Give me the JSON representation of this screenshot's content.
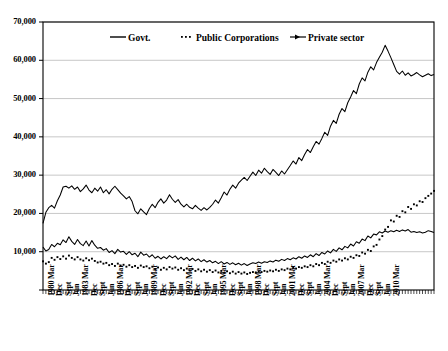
{
  "chart_data": {
    "type": "line",
    "title": "",
    "subtitle": "",
    "xlabel": "",
    "ylabel": "",
    "ylim": [
      0,
      70000
    ],
    "ytick_step": 10000,
    "ytick_labels": [
      "0",
      "10,000",
      "20,000",
      "30,000",
      "40,000",
      "50,000",
      "60,000",
      "70,000"
    ],
    "ytick_values": [
      0,
      10000,
      20000,
      30000,
      40000,
      50000,
      60000,
      70000
    ],
    "grid": "horizontal",
    "legend_position": "top-inside",
    "x_frequency": "quarterly",
    "x_start": "1980 Mar",
    "x_end": "2010 Mar",
    "xtick_labels": [
      "1980 Mar",
      "Dec",
      "Sept",
      "Jun",
      "1983 Mar",
      "Dec",
      "Sept",
      "Jun",
      "1986 Mar",
      "Dec",
      "Sept",
      "Jun",
      "1989 Mar",
      "Dec",
      "Sept",
      "Jun",
      "1992 Mar",
      "Dec",
      "Sept",
      "Jun",
      "1995 Mar",
      "Dec",
      "Sept",
      "Jun",
      "1998 Mar",
      "Dec",
      "Sept",
      "Jun",
      "2001 Mar",
      "Dec",
      "Sept",
      "Jun",
      "2004 Mar",
      "Dec",
      "Sept",
      "Jun",
      "2007 Mar",
      "Dec",
      "Sept",
      "Jun",
      "2010 Mar"
    ],
    "xtick_label_interval": 3,
    "series": [
      {
        "name": "Govt.",
        "style": "solid",
        "color": "#000000",
        "values": [
          11200,
          10200,
          10600,
          11900,
          11300,
          12200,
          11800,
          13100,
          12400,
          13900,
          12700,
          11900,
          13200,
          12100,
          11600,
          12800,
          11500,
          12900,
          11700,
          10900,
          11100,
          10400,
          10800,
          9800,
          10300,
          9500,
          10600,
          9900,
          10100,
          9300,
          10000,
          9200,
          9600,
          8700,
          9900,
          9100,
          9400,
          8600,
          9200,
          8300,
          8800,
          8100,
          8700,
          8200,
          9000,
          8400,
          8900,
          8000,
          8600,
          7900,
          8500,
          7700,
          8300,
          7600,
          8100,
          7400,
          7900,
          7300,
          7700,
          7100,
          7500,
          6900,
          7400,
          6800,
          7200,
          6700,
          7100,
          6600,
          7000,
          6500,
          6900,
          6400,
          6800,
          7100,
          6900,
          7300,
          7000,
          7400,
          7200,
          7600,
          7300,
          7800,
          7500,
          8000,
          7700,
          8200,
          7900,
          8400,
          8100,
          8700,
          8300,
          8900,
          8500,
          9200,
          8700,
          9500,
          9000,
          9800,
          9400,
          10200,
          9700,
          10600,
          10100,
          11000,
          10500,
          11400,
          11000,
          12000,
          11500,
          12600,
          12200,
          13300,
          12900,
          14100,
          13600,
          14600,
          14400,
          15200,
          14900,
          15400,
          15100,
          15500,
          15200,
          15600,
          15300,
          15700,
          15400,
          15800,
          15100,
          15300,
          15000,
          15200,
          14900,
          15100,
          15500,
          15300,
          15000
        ]
      },
      {
        "name": "Public Corporations",
        "style": "dotted",
        "color": "#000000",
        "values": [
          7500,
          6900,
          7300,
          8400,
          7900,
          8600,
          8100,
          8800,
          8200,
          9000,
          8400,
          8000,
          8600,
          8000,
          7700,
          8300,
          7800,
          8200,
          7600,
          7200,
          7400,
          6900,
          7100,
          6500,
          6800,
          6300,
          6900,
          6400,
          6600,
          6100,
          6500,
          6000,
          6300,
          5800,
          6400,
          6000,
          6200,
          5700,
          6100,
          5500,
          5900,
          5300,
          5800,
          5400,
          6000,
          5600,
          5900,
          5300,
          5700,
          5200,
          5600,
          5100,
          5500,
          5000,
          5400,
          4900,
          5300,
          4800,
          5200,
          4700,
          5100,
          4600,
          5000,
          4500,
          4900,
          4400,
          4800,
          4300,
          4700,
          4300,
          4600,
          4200,
          4500,
          4700,
          4600,
          4900,
          4700,
          5000,
          4800,
          5100,
          4900,
          5300,
          5000,
          5400,
          5200,
          5600,
          5400,
          5800,
          5600,
          6000,
          5800,
          6200,
          6000,
          6500,
          6200,
          6800,
          6500,
          7100,
          6800,
          7400,
          7100,
          7700,
          7400,
          8000,
          7700,
          8300,
          8000,
          8700,
          8400,
          9100,
          8900,
          9800,
          9500,
          10500,
          10200,
          11400,
          11800,
          13200,
          14100,
          15800,
          16500,
          18200,
          17900,
          19400,
          19100,
          20600,
          20300,
          21700,
          21200,
          22400,
          22100,
          23200,
          23000,
          24000,
          24600,
          25200,
          25900
        ]
      },
      {
        "name": "Private sector",
        "style": "solid",
        "color": "#000000",
        "values": [
          17400,
          20300,
          21500,
          22100,
          21400,
          23300,
          24800,
          26900,
          27100,
          26600,
          27200,
          26300,
          26900,
          25700,
          26400,
          27400,
          26100,
          25400,
          26600,
          25800,
          26900,
          25400,
          26200,
          25100,
          26300,
          27100,
          26200,
          25300,
          24600,
          23800,
          24400,
          23100,
          20700,
          19900,
          21200,
          20400,
          19700,
          21300,
          22400,
          21500,
          22900,
          23800,
          22700,
          23500,
          24900,
          23700,
          22900,
          23600,
          22400,
          21700,
          22400,
          21600,
          21200,
          22100,
          21400,
          20800,
          21500,
          20900,
          21600,
          22400,
          23500,
          22700,
          24100,
          25600,
          24800,
          26300,
          27400,
          26600,
          27900,
          28700,
          29400,
          28600,
          29700,
          30800,
          29900,
          31300,
          30500,
          31800,
          30900,
          30200,
          31500,
          30700,
          29900,
          31100,
          30300,
          31400,
          32500,
          33700,
          32900,
          34600,
          33800,
          35400,
          36700,
          35900,
          37400,
          38800,
          38100,
          39600,
          41200,
          40400,
          42800,
          44300,
          43500,
          45900,
          47400,
          46600,
          48900,
          50400,
          52100,
          51300,
          53800,
          55400,
          54600,
          56900,
          58300,
          57500,
          59400,
          60800,
          62100,
          63900,
          62400,
          60700,
          58900,
          57100,
          56400,
          57200,
          56100,
          56700,
          55900,
          56300,
          56800,
          56200,
          55700,
          56100,
          56500,
          56000,
          56300
        ]
      }
    ]
  },
  "legend": {
    "items": [
      {
        "label": "Govt.",
        "marker": "solid-line"
      },
      {
        "label": "Public Corporations",
        "marker": "dotted-line"
      },
      {
        "label": "Private sector",
        "marker": "solid-line-with-marker"
      }
    ]
  }
}
